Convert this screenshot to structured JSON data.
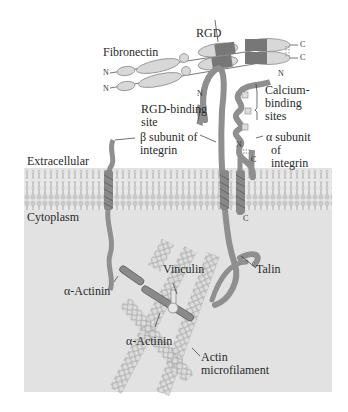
{
  "figure": {
    "regions": {
      "extracellular": "Extracellular",
      "cytoplasm": "Cytoplasm"
    },
    "labels": {
      "fibronectin": "Fibronectin",
      "rgd": "RGD",
      "rgd_binding_1": "RGD-binding",
      "rgd_binding_2": "site",
      "calcium_1": "Calcium-",
      "calcium_2": "binding",
      "calcium_3": "sites",
      "beta_1": "β subunit of",
      "beta_2": "integrin",
      "alpha_1": "α subunit",
      "alpha_2": "of",
      "alpha_3": "integrin",
      "vinculin": "Vinculin",
      "talin": "Talin",
      "actinin_1": "α-Actinin",
      "actinin_2": "α-Actinin",
      "actin_1": "Actin",
      "actin_2": "microfilament"
    },
    "termini": {
      "n": "N",
      "c": "C"
    },
    "colors": {
      "cytoplasm": "#e2e2e2",
      "membrane_tails": "#c8c8c8",
      "membrane_heads": "#d6d6d6",
      "protein_dark": "#7a7a7a",
      "protein_mid": "#a0a0a0",
      "protein_light": "#d4d4d4"
    }
  }
}
